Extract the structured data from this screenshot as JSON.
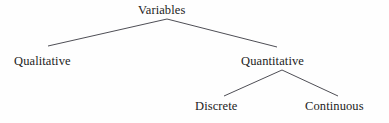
{
  "diagram": {
    "type": "tree",
    "background_color": "#fefefe",
    "line_color": "#3a3a42",
    "text_color": "#1c1c1c",
    "width": 389,
    "height": 123,
    "nodes": [
      {
        "id": "variables",
        "label": "Variables",
        "level": 0,
        "x": 138,
        "y": 3,
        "anchor_x": 167,
        "anchor_y": 19
      },
      {
        "id": "qualitative",
        "label": "Qualitative",
        "level": 1,
        "x": 14,
        "y": 54,
        "anchor_x": 48,
        "anchor_y": 46
      },
      {
        "id": "quantitative",
        "label": "Quantitative",
        "level": 1,
        "x": 241,
        "y": 54,
        "anchor_x": 277,
        "anchor_y": 47
      },
      {
        "id": "discrete",
        "label": "Discrete",
        "level": 2,
        "x": 195,
        "y": 99,
        "anchor_x": 224,
        "anchor_y": 96
      },
      {
        "id": "continuous",
        "label": "Continuous",
        "level": 2,
        "x": 305,
        "y": 99,
        "anchor_x": 338,
        "anchor_y": 96
      }
    ],
    "edges": [
      {
        "id": "edge-variables-qualitative",
        "from": "variables",
        "to": "qualitative",
        "x1": 167,
        "y1": 19,
        "x2": 48,
        "y2": 46
      },
      {
        "id": "edge-variables-quantitative",
        "from": "variables",
        "to": "quantitative",
        "x1": 167,
        "y1": 19,
        "x2": 277,
        "y2": 47
      },
      {
        "id": "edge-quantitative-discrete",
        "from": "quantitative",
        "to": "discrete",
        "x1": 282,
        "y1": 70,
        "x2": 224,
        "y2": 96
      },
      {
        "id": "edge-quantitative-continuous",
        "from": "quantitative",
        "to": "continuous",
        "x1": 282,
        "y1": 70,
        "x2": 338,
        "y2": 96
      }
    ]
  }
}
